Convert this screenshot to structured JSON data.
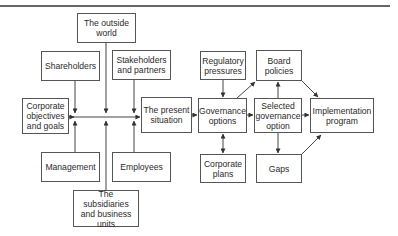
{
  "diagram": {
    "nodes": [
      {
        "id": "outside-world",
        "label": "The outside\nworld",
        "x": 77,
        "y": 13,
        "w": 59,
        "h": 30
      },
      {
        "id": "shareholders",
        "label": "Shareholders",
        "x": 41,
        "y": 51,
        "w": 59,
        "h": 30
      },
      {
        "id": "stakeholders",
        "label": "Stakeholders\nand partners",
        "x": 112,
        "y": 50,
        "w": 59,
        "h": 30
      },
      {
        "id": "corporate-objectives",
        "label": "Corporate\nobjectives\nand goals",
        "x": 22,
        "y": 98,
        "w": 47,
        "h": 36
      },
      {
        "id": "management",
        "label": "Management",
        "x": 41,
        "y": 152,
        "w": 59,
        "h": 30
      },
      {
        "id": "employees",
        "label": "Employees",
        "x": 112,
        "y": 152,
        "w": 59,
        "h": 30
      },
      {
        "id": "subsidiaries",
        "label": "The subsidiaries\nand business\nunits",
        "x": 73,
        "y": 190,
        "w": 66,
        "h": 37
      },
      {
        "id": "present-situation",
        "label": "The present\nsituation",
        "x": 141,
        "y": 97,
        "w": 51,
        "h": 36
      },
      {
        "id": "regulatory-pressures",
        "label": "Regulatory\npressures",
        "x": 200,
        "y": 51,
        "w": 46,
        "h": 29
      },
      {
        "id": "governance-options",
        "label": "Governance\noptions",
        "x": 198,
        "y": 98,
        "w": 49,
        "h": 35
      },
      {
        "id": "corporate-plans",
        "label": "Corporate\nplans",
        "x": 200,
        "y": 154,
        "w": 46,
        "h": 29
      },
      {
        "id": "board-policies",
        "label": "Board\npolicies",
        "x": 256,
        "y": 50,
        "w": 46,
        "h": 31
      },
      {
        "id": "selected-governance-option",
        "label": "Selected\ngovernance\noption",
        "x": 254,
        "y": 98,
        "w": 48,
        "h": 35
      },
      {
        "id": "gaps",
        "label": "Gaps",
        "x": 256,
        "y": 154,
        "w": 46,
        "h": 29
      },
      {
        "id": "implementation-program",
        "label": "Implementation\nprogram",
        "x": 310,
        "y": 98,
        "w": 64,
        "h": 35
      }
    ],
    "edges": [
      {
        "from": "shareholders",
        "to": "bus",
        "direction": "down"
      },
      {
        "from": "outside-world",
        "to": "bus",
        "direction": "down"
      },
      {
        "from": "stakeholders",
        "to": "bus",
        "direction": "down"
      },
      {
        "from": "management",
        "to": "bus",
        "direction": "up"
      },
      {
        "from": "subsidiaries",
        "to": "bus",
        "direction": "up"
      },
      {
        "from": "employees",
        "to": "bus",
        "direction": "up"
      },
      {
        "from": "corporate-objectives",
        "to": "bus",
        "direction": "right"
      },
      {
        "from": "bus",
        "to": "present-situation",
        "direction": "right"
      },
      {
        "from": "present-situation",
        "to": "governance-options"
      },
      {
        "from": "regulatory-pressures",
        "to": "governance-options"
      },
      {
        "from": "corporate-plans",
        "to": "governance-options",
        "bidirectional": true
      },
      {
        "from": "governance-options",
        "to": "board-policies"
      },
      {
        "from": "governance-options",
        "to": "selected-governance-option"
      },
      {
        "from": "selected-governance-option",
        "to": "board-policies"
      },
      {
        "from": "selected-governance-option",
        "to": "gaps"
      },
      {
        "from": "selected-governance-option",
        "to": "implementation-program"
      },
      {
        "from": "board-policies",
        "to": "implementation-program"
      },
      {
        "from": "gaps",
        "to": "implementation-program"
      }
    ],
    "colors": {
      "line": "#444444",
      "border": "#555555",
      "text": "#2a2a2a"
    }
  }
}
